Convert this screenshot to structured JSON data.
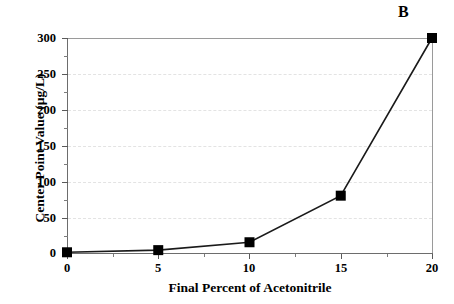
{
  "panel": {
    "label": "B"
  },
  "chart_data": {
    "type": "line",
    "title": "",
    "subtitle": "",
    "panel_label": "B",
    "xlabel": "Final Percent of Acetonitrile",
    "ylabel": "Center Point Value (µg/L)",
    "x": [
      0,
      5,
      10,
      15,
      20
    ],
    "values": [
      1,
      4,
      15,
      80,
      300
    ],
    "series": [
      {
        "name": "Center Point Value",
        "x": [
          0,
          5,
          10,
          15,
          20
        ],
        "values": [
          1,
          4,
          15,
          80,
          300
        ],
        "marker": "square",
        "marker_color": "#000000",
        "line_color": "#1a1a1a"
      }
    ],
    "xlim": [
      0,
      20
    ],
    "ylim": [
      0,
      300
    ],
    "xticks": [
      0,
      5,
      10,
      15,
      20
    ],
    "xtick_labels": [
      "0",
      "5",
      "10",
      "15",
      "20"
    ],
    "x_minor_ticks": [
      2.5,
      7.5,
      12.5,
      17.5
    ],
    "yticks": [
      0,
      50,
      100,
      150,
      200,
      250,
      300
    ],
    "ytick_labels": [
      "0",
      "50",
      "100",
      "150",
      "200",
      "250",
      "300"
    ],
    "y_minor_ticks": [
      25,
      75,
      125,
      175,
      225,
      275
    ],
    "grid": {
      "horizontal": true,
      "vertical": false,
      "color": "#e3e3e3",
      "style": "dashed"
    },
    "legend": {
      "visible": false,
      "position": "none",
      "entries": []
    },
    "annotations": []
  },
  "colors": {
    "axis": "#6d6d6d",
    "spine_light": "#9a9a9a",
    "grid": "#e3e3e3",
    "marker": "#000000",
    "line": "#1a1a1a",
    "background": "#ffffff",
    "text": "#000000"
  }
}
